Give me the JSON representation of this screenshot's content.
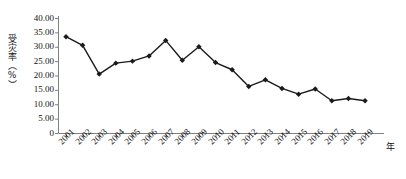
{
  "chart_data": {
    "type": "line",
    "title": "",
    "xlabel": "年",
    "ylabel": "受灾率（%）",
    "categories": [
      "2001",
      "2002",
      "2003",
      "2004",
      "2005",
      "2006",
      "2007",
      "2008",
      "2009",
      "2010",
      "2011",
      "2012",
      "2013",
      "2014",
      "2015",
      "2016",
      "2017",
      "2018",
      "2019"
    ],
    "values": [
      33.5,
      30.5,
      20.5,
      24.3,
      25.0,
      26.8,
      32.2,
      25.3,
      30.0,
      24.5,
      22.0,
      16.2,
      18.5,
      15.5,
      13.5,
      15.3,
      11.2,
      12.0,
      11.2
    ],
    "series": [
      {
        "name": "受灾率",
        "values": [
          33.5,
          30.5,
          20.5,
          24.3,
          25.0,
          26.8,
          32.2,
          25.3,
          30.0,
          24.5,
          22.0,
          16.2,
          18.5,
          15.5,
          13.5,
          15.3,
          11.2,
          12.0,
          11.2
        ]
      }
    ],
    "ylim": [
      0,
      40
    ],
    "yticks": [
      0,
      5,
      10,
      15,
      20,
      25,
      30,
      35,
      40
    ],
    "ytick_labels": [
      "0",
      "5.00",
      "10.00",
      "15.00",
      "20.00",
      "25.00",
      "30.00",
      "35.00",
      "40.00"
    ],
    "grid": false,
    "legend": "none",
    "marker": "diamond",
    "line_color": "#1a1a1a",
    "marker_color": "#1a1a1a",
    "axis_color": "#808080"
  }
}
